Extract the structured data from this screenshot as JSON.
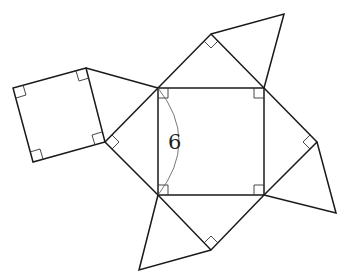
{
  "diagram": {
    "type": "geometric-net",
    "center_square": {
      "side_label": "6",
      "vertices": [
        [
          158,
          88
        ],
        [
          264,
          88
        ],
        [
          264,
          195
        ],
        [
          158,
          195
        ]
      ]
    },
    "triangles": [
      {
        "name": "top",
        "points": [
          [
            158,
            88
          ],
          [
            211,
            34
          ],
          [
            264,
            88
          ]
        ]
      },
      {
        "name": "right",
        "points": [
          [
            264,
            88
          ],
          [
            317,
            142
          ],
          [
            264,
            195
          ]
        ]
      },
      {
        "name": "bottom",
        "points": [
          [
            264,
            195
          ],
          [
            211,
            250
          ],
          [
            158,
            195
          ]
        ]
      },
      {
        "name": "left",
        "points": [
          [
            158,
            195
          ],
          [
            105,
            142
          ],
          [
            158,
            88
          ]
        ]
      }
    ],
    "outer_shapes": [
      {
        "name": "top-right-triangle",
        "points": [
          [
            211,
            34
          ],
          [
            284,
            14
          ],
          [
            264,
            88
          ]
        ]
      },
      {
        "name": "right-triangle",
        "points": [
          [
            317,
            142
          ],
          [
            336,
            213
          ],
          [
            264,
            195
          ]
        ]
      },
      {
        "name": "bottom-triangle",
        "points": [
          [
            158,
            195
          ],
          [
            139,
            270
          ],
          [
            211,
            250
          ]
        ]
      },
      {
        "name": "left-square",
        "points": [
          [
            86,
            68
          ],
          [
            13,
            88
          ],
          [
            33,
            162
          ],
          [
            105,
            142
          ]
        ]
      },
      {
        "name": "left-top-triangle",
        "points": [
          [
            86,
            68
          ],
          [
            158,
            88
          ],
          [
            105,
            142
          ]
        ]
      }
    ],
    "colors": {
      "stroke": "#1a1a1a",
      "background": "#ffffff"
    }
  }
}
